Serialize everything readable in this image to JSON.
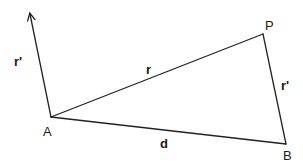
{
  "diagram": {
    "title": "",
    "points": {
      "A": {
        "label": "A",
        "x": 51,
        "y": 117
      },
      "P": {
        "label": "P",
        "x": 263,
        "y": 34
      },
      "B": {
        "label": "B",
        "x": 286,
        "y": 144
      },
      "arrow_tip": {
        "x": 29,
        "y": 12
      }
    },
    "edges": {
      "AP": {
        "label": "r",
        "from": "A",
        "to": "P"
      },
      "AB": {
        "label": "d",
        "from": "A",
        "to": "B"
      },
      "BP": {
        "label": "r'",
        "from": "B",
        "to": "P"
      },
      "A_arrow": {
        "label": "r'",
        "from": "A",
        "to": "arrow_tip",
        "arrow": true
      }
    },
    "labels": {
      "vertex_A": "A",
      "vertex_P": "P",
      "vertex_B": "B",
      "edge_r": "r",
      "edge_d": "d",
      "edge_r_prime_right": "r'",
      "vector_r_prime_left": "r'"
    },
    "colors": {
      "line": "#222222",
      "text": "#1a1a1a",
      "background": "#ffffff"
    }
  }
}
